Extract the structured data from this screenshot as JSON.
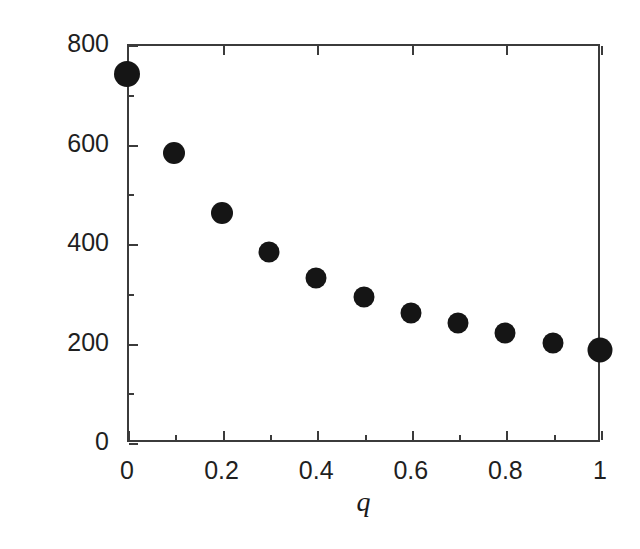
{
  "chart_data": {
    "type": "scatter",
    "title": "",
    "xlabel": "q",
    "ylabel": "Corridor width",
    "xlim": [
      0,
      1
    ],
    "ylim": [
      0,
      800
    ],
    "grid": false,
    "legend": null,
    "marker_color": "#151515",
    "axis_color": "#3b3b3b",
    "background": "#ffffff",
    "x_ticks": [
      0,
      0.2,
      0.4,
      0.6,
      0.8,
      1
    ],
    "x_tick_labels": [
      "0",
      "0.2",
      "0.4",
      "0.6",
      "0.8",
      "1"
    ],
    "x_minor_ticks": [
      0.1,
      0.3,
      0.5,
      0.7,
      0.9
    ],
    "y_ticks": [
      0,
      200,
      400,
      600,
      800
    ],
    "y_tick_labels": [
      "0",
      "200",
      "400",
      "600",
      "800"
    ],
    "y_minor_ticks": [
      100,
      300,
      500,
      700
    ],
    "x": [
      0,
      0.1,
      0.2,
      0.3,
      0.4,
      0.5,
      0.6,
      0.7,
      0.8,
      0.9,
      1
    ],
    "values": [
      740,
      580,
      460,
      382,
      330,
      292,
      260,
      240,
      220,
      200,
      185
    ],
    "marker_sizes": [
      26,
      22,
      22,
      21,
      21,
      21,
      21,
      21,
      21,
      21,
      25
    ]
  }
}
